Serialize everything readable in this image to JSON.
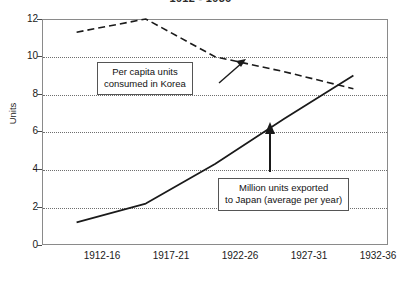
{
  "chart_data": {
    "type": "line",
    "title": "1912 - 1936",
    "xlabel": "",
    "ylabel": "Units",
    "ylim": [
      0,
      12
    ],
    "yticks": [
      0,
      2,
      4,
      6,
      8,
      10,
      12
    ],
    "grid": true,
    "legend": "none (in-plot callout boxes)",
    "categories": [
      "1912-16",
      "1917-21",
      "1922-26",
      "1927-31",
      "1932-36"
    ],
    "series": [
      {
        "name": "Per capita units consumed in Korea",
        "style": "dashed",
        "color": "#1a1a1a",
        "values": [
          11.3,
          12.0,
          10.0,
          9.2,
          8.3
        ]
      },
      {
        "name": "Million units exported to Japan (average per year)",
        "style": "solid",
        "color": "#1a1a1a",
        "values": [
          1.2,
          2.2,
          4.3,
          6.7,
          9.0
        ]
      }
    ],
    "annotations": [
      {
        "id": "korea-callout",
        "text_line1": "Per capita units",
        "text_line2": "consumed in Korea",
        "arrow": "diagonal-up-right",
        "points_to_series": "Per capita units consumed in Korea"
      },
      {
        "id": "japan-callout",
        "text_line1": "Million units exported",
        "text_line2": "to Japan (average per year)",
        "arrow": "vertical-up",
        "points_to_series": "Million units exported to Japan (average per year)"
      }
    ]
  },
  "axes": {
    "y_title": "Units",
    "y_tick_labels": [
      "0",
      "2",
      "4",
      "6",
      "8",
      "10",
      "12"
    ],
    "x_tick_labels": [
      "1912-16",
      "1917-21",
      "1922-26",
      "1927-31",
      "1932-36"
    ]
  },
  "callouts": {
    "korea": {
      "line1": "Per capita units",
      "line2": "consumed in Korea"
    },
    "japan": {
      "line1": "Million units exported",
      "line2": "to Japan (average per year)"
    }
  },
  "colors": {
    "ink": "#1a1a1a",
    "frame": "#8a8a8a",
    "grid": "#6e6e6e",
    "background": "#ffffff"
  }
}
